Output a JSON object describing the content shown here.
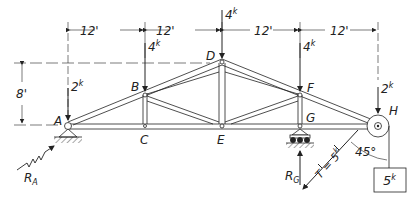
{
  "diagram": {
    "type": "truss-free-body",
    "colors": {
      "ink": "#222222",
      "background": "#ffffff"
    },
    "nodes": {
      "A": {
        "label": "A"
      },
      "B": {
        "label": "B"
      },
      "C": {
        "label": "C"
      },
      "D": {
        "label": "D"
      },
      "E": {
        "label": "E"
      },
      "F": {
        "label": "F"
      },
      "G": {
        "label": "G"
      },
      "H": {
        "label": "H"
      }
    },
    "dimensions": {
      "spans": [
        "12'",
        "12'",
        "12'",
        "12'"
      ],
      "height": "8'"
    },
    "loads": {
      "A": {
        "value": "2",
        "unit": "k"
      },
      "B": {
        "value": "4",
        "unit": "k"
      },
      "D": {
        "value": "4",
        "unit": "k"
      },
      "F": {
        "value": "4",
        "unit": "k"
      },
      "H": {
        "value": "2",
        "unit": "k"
      }
    },
    "reactions": {
      "RA": {
        "symbol": "R",
        "sub": "A"
      },
      "RG": {
        "symbol": "R",
        "sub": "G"
      }
    },
    "cable": {
      "tension_label": "T = 5",
      "tension_unit": "k",
      "angle": "45°",
      "weight_value": "5",
      "weight_unit": "k"
    }
  }
}
